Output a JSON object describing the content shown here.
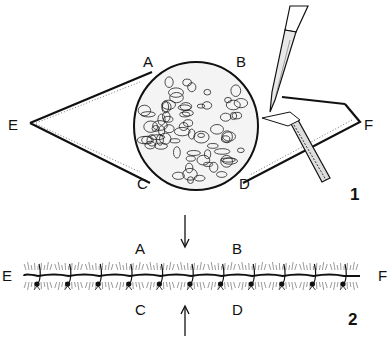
{
  "figure_1": {
    "number": "1",
    "labels": {
      "A": "A",
      "B": "B",
      "C": "C",
      "D": "D",
      "E": "E",
      "F": "F"
    },
    "subject": "elliptical skin incision around a round mass, being dissected with scalpel and forceps"
  },
  "figure_2": {
    "number": "2",
    "labels": {
      "A": "A",
      "B": "B",
      "C": "C",
      "D": "D",
      "E": "E",
      "F": "F"
    },
    "subject": "closed incision line with interrupted sutures",
    "suture_count": 11
  },
  "colors": {
    "ink": "#111111",
    "paper": "#ffffff"
  }
}
